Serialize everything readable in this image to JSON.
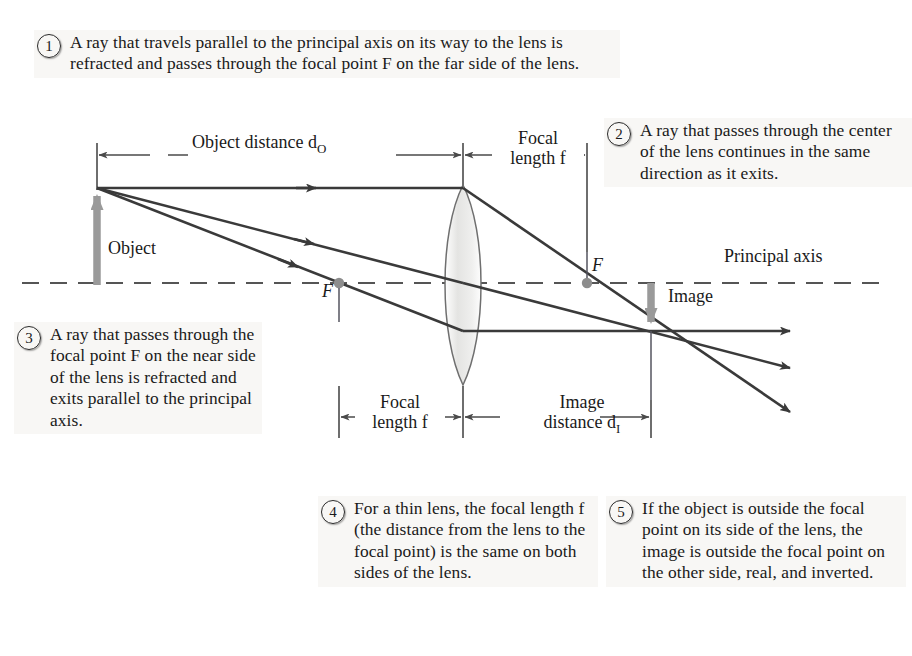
{
  "figure": {
    "type": "optics-ray-diagram"
  },
  "callouts": [
    {
      "number": "1",
      "text": "A ray that travels parallel to the principal axis on its way to the lens is refracted and passes through the focal point F on the far side of the lens."
    },
    {
      "number": "2",
      "text": "A ray that passes through the center of the lens continues in the same direction as it exits."
    },
    {
      "number": "3",
      "text": "A ray that passes through the focal point F on the near side of the lens is refracted and exits parallel to the principal axis."
    },
    {
      "number": "4",
      "text": "For a thin lens, the focal length f (the distance from the lens to the focal point) is the same on both sides of the lens."
    },
    {
      "number": "5",
      "text": "If the object is outside the focal point on its side of the lens, the image is outside the focal point on the other side, real, and inverted."
    }
  ],
  "diagram_labels": {
    "object_distance": "Object distance d",
    "object_distance_sub": "O",
    "focal_length_top_line1": "Focal",
    "focal_length_top_line2": "length f",
    "object": "Object",
    "principal_axis": "Principal axis",
    "image": "Image",
    "focal_point_near": "F",
    "focal_point_far": "F",
    "focal_length_bottom_line1": "Focal",
    "focal_length_bottom_line2": "length f",
    "image_distance_line1": "Image",
    "image_distance_line2": "distance d",
    "image_distance_sub": "I"
  },
  "colors": {
    "ray": "#3a3a3a",
    "axis": "#4a4a4a",
    "object_arrow": "#9a9a9a",
    "image_arrow": "#9a9a9a",
    "focal_dot": "#8d8d8d",
    "lens_fill": "#e8e8e6",
    "lens_stroke": "#6f6f6f",
    "text": "#1a1a1a",
    "callout_bg": "#f6f4f1"
  },
  "geometry": {
    "object_tip": [
      97,
      188
    ],
    "object_base": [
      97,
      285
    ],
    "lens_center": [
      463,
      283
    ],
    "lens_top": [
      463,
      185
    ],
    "lens_bottom": [
      463,
      385
    ],
    "focal_near": [
      339,
      283
    ],
    "focal_far": [
      587,
      283
    ],
    "image_tip": [
      651,
      331
    ],
    "image_base": [
      651,
      283
    ],
    "axis_y": 283
  }
}
